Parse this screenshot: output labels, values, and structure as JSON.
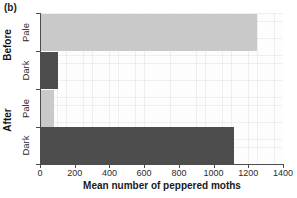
{
  "figure": {
    "panel_label": "(b)"
  },
  "axes": {
    "x_title": "Mean number of peppered moths",
    "x_ticks": [
      "0",
      "200",
      "400",
      "600",
      "800",
      "1000",
      "1200",
      "1400"
    ],
    "group_labels": [
      "Before",
      "After"
    ],
    "category_labels": [
      "Pale",
      "Dark",
      "Pale",
      "Dark"
    ]
  },
  "colors": {
    "pale_bar": "#c9c9c9",
    "dark_bar": "#4d4d4d",
    "axis": "#4d4d4d",
    "plot_background": "#fdfdfd",
    "text": "#1a1a1a"
  },
  "chart_data": {
    "type": "bar",
    "orientation": "horizontal",
    "title": "(b)",
    "xlabel": "Mean number of peppered moths",
    "ylabel": "",
    "xlim": [
      0,
      1400
    ],
    "xticks": [
      0,
      200,
      400,
      600,
      800,
      1000,
      1200,
      1400
    ],
    "grid": true,
    "legend": "none",
    "groups": [
      "Before",
      "After"
    ],
    "categories": [
      "Before / Pale",
      "Before / Dark",
      "After / Pale",
      "After / Dark"
    ],
    "values": [
      1250,
      105,
      80,
      1120
    ],
    "bars": [
      {
        "group": "Before",
        "morph": "Pale",
        "value": 1250,
        "color": "#c9c9c9"
      },
      {
        "group": "Before",
        "morph": "Dark",
        "value": 105,
        "color": "#4d4d4d"
      },
      {
        "group": "After",
        "morph": "Pale",
        "value": 80,
        "color": "#c9c9c9"
      },
      {
        "group": "After",
        "morph": "Dark",
        "value": 1120,
        "color": "#4d4d4d"
      }
    ]
  }
}
